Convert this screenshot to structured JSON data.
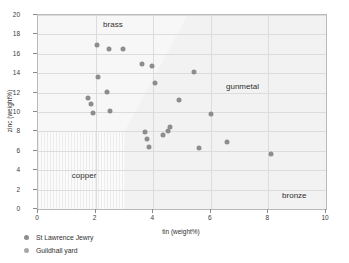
{
  "chart_data": {
    "type": "scatter",
    "title": "",
    "xlabel": "tin (weight%)",
    "ylabel": "zinc (weight%)",
    "xlim": [
      0,
      10
    ],
    "ylim": [
      0,
      20
    ],
    "xticks": [
      "0",
      "2",
      "4",
      "6",
      "8",
      "10"
    ],
    "yticks": [
      "0",
      "2",
      "4",
      "6",
      "8",
      "10",
      "12",
      "14",
      "16",
      "18",
      "20"
    ],
    "grid": true,
    "legend_position": "below-left",
    "series": [
      {
        "name": "St Lawrence Jewry",
        "color": "#8d8d8d",
        "points": [
          [
            2.05,
            16.9
          ],
          [
            2.45,
            16.5
          ],
          [
            2.95,
            16.45
          ],
          [
            2.1,
            13.6
          ],
          [
            2.4,
            12.1
          ],
          [
            1.75,
            11.45
          ],
          [
            1.85,
            10.8
          ],
          [
            1.9,
            9.85
          ],
          [
            2.5,
            10.15
          ],
          [
            3.6,
            15.0
          ],
          [
            3.95,
            14.75
          ],
          [
            4.05,
            13.0
          ],
          [
            5.4,
            14.1
          ],
          [
            4.9,
            11.2
          ],
          [
            6.0,
            9.75
          ],
          [
            3.7,
            7.95
          ],
          [
            3.8,
            7.25
          ],
          [
            3.85,
            6.35
          ],
          [
            4.35,
            7.6
          ],
          [
            4.5,
            8.0
          ],
          [
            4.6,
            8.5
          ],
          [
            5.6,
            6.25
          ],
          [
            6.55,
            6.9
          ],
          [
            8.1,
            5.65
          ]
        ]
      },
      {
        "name": "Guildhall yard",
        "color": "#a8a8a8",
        "points": []
      }
    ],
    "annotations": [
      {
        "label": "brass",
        "x": 2.6,
        "y": 19.1
      },
      {
        "label": "gunmetal",
        "x": 7.1,
        "y": 12.7
      },
      {
        "label": "copper",
        "x": 1.6,
        "y": 3.5
      },
      {
        "label": "bronze",
        "x": 8.9,
        "y": 1.45
      }
    ],
    "regions": [
      {
        "name": "brass-copper-field",
        "shade": "#f7f7f7"
      },
      {
        "name": "gunmetal-bronze-field",
        "shade": "#f2f2f2"
      },
      {
        "name": "copper-hatched-box",
        "x_range": [
          0,
          3
        ],
        "y_range": [
          0,
          8
        ]
      }
    ]
  },
  "legend": {
    "items": [
      {
        "label": "St Lawrence Jewry",
        "series": "s-jewry"
      },
      {
        "label": "Guildhall yard",
        "series": "s-guild"
      }
    ]
  }
}
